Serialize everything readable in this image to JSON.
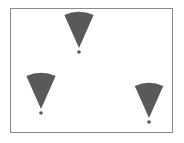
{
  "diagram": {
    "frame": {
      "x": 10,
      "y": 8,
      "width": 163,
      "height": 125,
      "stroke": "#8a8a8a"
    },
    "fill_color": "#595959",
    "wedges": [
      {
        "id": "top",
        "apex_x": 79,
        "apex_y": 48,
        "radius": 36,
        "half_angle_deg": 24,
        "dot_y": 52
      },
      {
        "id": "left",
        "apex_x": 41,
        "apex_y": 109,
        "radius": 36,
        "half_angle_deg": 24,
        "dot_y": 113
      },
      {
        "id": "right",
        "apex_x": 149,
        "apex_y": 118,
        "radius": 35,
        "half_angle_deg": 24,
        "dot_y": 122
      }
    ]
  }
}
